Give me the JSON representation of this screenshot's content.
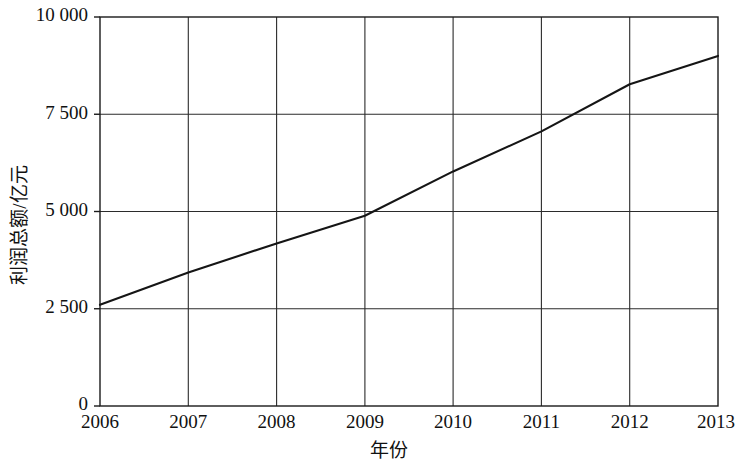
{
  "chart_data": {
    "type": "line",
    "title": "",
    "subtitle": "",
    "xlabel": "年份",
    "ylabel": "利润总额/亿元",
    "categories": [
      "2006",
      "2007",
      "2008",
      "2009",
      "2010",
      "2011",
      "2012",
      "2013"
    ],
    "x": [
      2006,
      2007,
      2008,
      2009,
      2010,
      2011,
      2012,
      2013
    ],
    "values": [
      2600,
      3430,
      4180,
      4890,
      6030,
      7060,
      8270,
      9000
    ],
    "series": [
      {
        "name": "利润总额",
        "values": [
          2600,
          3430,
          4180,
          4890,
          6030,
          7060,
          8270,
          9000
        ]
      }
    ],
    "xlim": [
      2006,
      2013
    ],
    "ylim": [
      0,
      10000
    ],
    "x_ticks": [
      "2006",
      "2007",
      "2008",
      "2009",
      "2010",
      "2011",
      "2012",
      "2013"
    ],
    "y_ticks": [
      "0",
      "2 500",
      "5 000",
      "7 500",
      "10 000"
    ],
    "y_tick_values": [
      0,
      2500,
      5000,
      7500,
      10000
    ],
    "grid": "both",
    "legend": "none",
    "line_color": "#151515",
    "frame_color": "#1a1a1a",
    "background_color": "#ffffff",
    "annotations": []
  },
  "axes": {
    "y_tick_0": "0",
    "y_tick_1": "2 500",
    "y_tick_2": "5 000",
    "y_tick_3": "7 500",
    "y_tick_4": "10 000",
    "x_tick_0": "2006",
    "x_tick_1": "2007",
    "x_tick_2": "2008",
    "x_tick_3": "2009",
    "x_tick_4": "2010",
    "x_tick_5": "2011",
    "x_tick_6": "2012",
    "x_tick_7": "2013",
    "x_axis_title": "年份",
    "y_axis_title": "利润总额/亿元"
  }
}
